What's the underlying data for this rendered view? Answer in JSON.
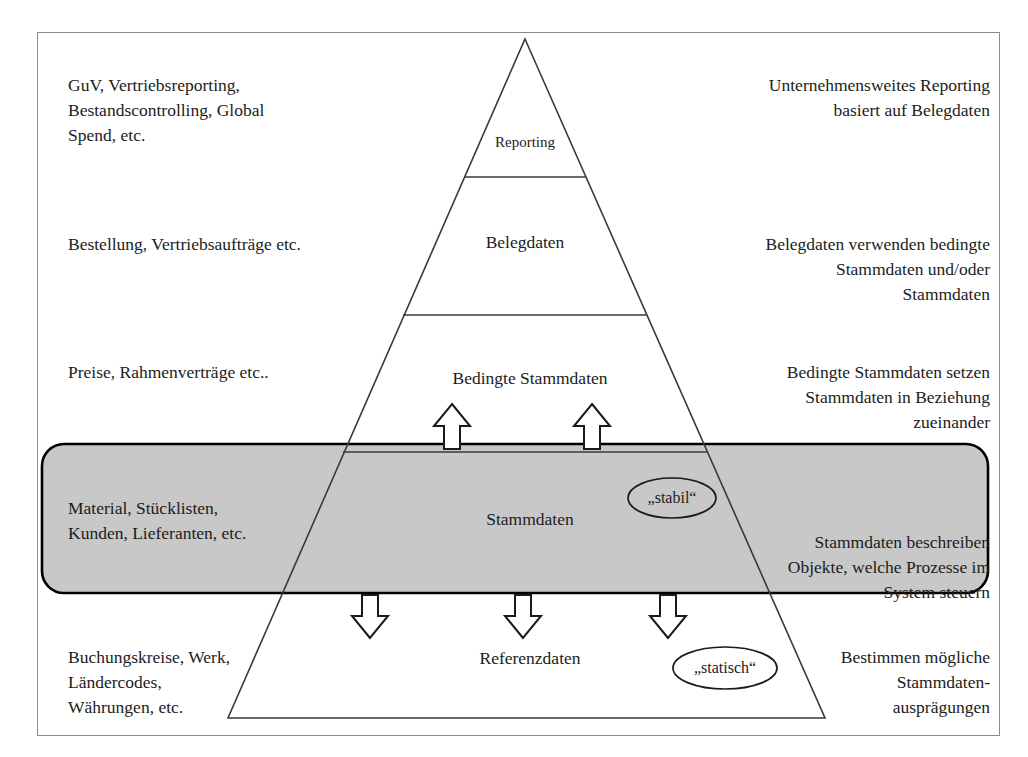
{
  "diagram": {
    "frame": {
      "border_color": "#8c8c8c"
    },
    "colors": {
      "band_fill": "#c8c8c8",
      "band_stroke": "#000000",
      "line": "#3a3a3a",
      "text": "#1c1c1c",
      "ellipse_fill_white": "#ffffff"
    },
    "pyramid": {
      "apex_label": "Reporting",
      "tiers": [
        {
          "id": "reporting",
          "label": "Reporting"
        },
        {
          "id": "belegdaten",
          "label": "Belegdaten"
        },
        {
          "id": "bedingte-stammdaten",
          "label": "Bedingte Stammdaten"
        },
        {
          "id": "stammdaten",
          "label": "Stammdaten"
        },
        {
          "id": "referenzdaten",
          "label": "Referenzdaten"
        }
      ]
    },
    "left_annotations": [
      {
        "id": "reporting",
        "text": "GuV, Vertriebsreporting,\nBestandscontrolling, Global\nSpend, etc."
      },
      {
        "id": "belegdaten",
        "text": "Bestellung, Vertriebsaufträge etc."
      },
      {
        "id": "bedingte-stammdaten",
        "text": "Preise, Rahmenverträge etc.."
      },
      {
        "id": "stammdaten",
        "text": "Material, Stücklisten,\nKunden, Lieferanten, etc."
      },
      {
        "id": "referenzdaten",
        "text": "Buchungskreise, Werk,\nLändercodes,\nWährungen, etc."
      }
    ],
    "right_annotations": [
      {
        "id": "reporting",
        "text": "Unternehmensweites Reporting\nbasiert auf Belegdaten"
      },
      {
        "id": "belegdaten",
        "text": "Belegdaten verwenden bedingte\nStammdaten und/oder\nStammdaten"
      },
      {
        "id": "bedingte-stammdaten",
        "text": "Bedingte Stammdaten setzen\nStammdaten in Beziehung\nzueinander"
      },
      {
        "id": "stammdaten",
        "text": "Stammdaten beschreiben\nObjekte, welche Prozesse im\nSystem steuern"
      },
      {
        "id": "referenzdaten",
        "text": "Bestimmen mögliche\nStammdaten-\nausprägungen"
      }
    ],
    "callouts": [
      {
        "id": "stabil",
        "text": "„stabil“"
      },
      {
        "id": "statisch",
        "text": "„statisch“"
      }
    ],
    "arrows": {
      "up_count": 2,
      "down_count": 3,
      "up_direction": "up",
      "down_direction": "down"
    }
  }
}
